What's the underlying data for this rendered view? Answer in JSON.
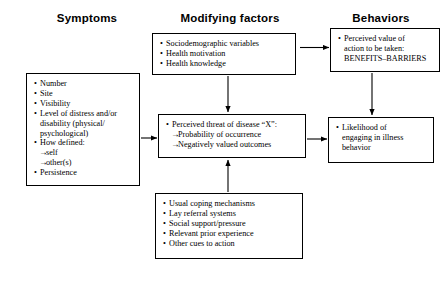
{
  "headers": [
    {
      "label": "Symptoms"
    },
    {
      "label": "Modifying factors"
    },
    {
      "label": "Behaviors"
    }
  ],
  "boxes": {
    "symptoms": {
      "name": "symptoms-box",
      "items": [
        {
          "text": "Number",
          "style": "bullet"
        },
        {
          "text": "Site",
          "style": "bullet"
        },
        {
          "text": "Visibility",
          "style": "bullet"
        },
        {
          "text": "Level of distress and/or",
          "style": "bullet"
        },
        {
          "text": "disability (physical/",
          "style": "cont"
        },
        {
          "text": "psychological)",
          "style": "cont"
        },
        {
          "text": "How defined:",
          "style": "bullet"
        },
        {
          "text": "self",
          "style": "sub"
        },
        {
          "text": "other(s)",
          "style": "sub"
        },
        {
          "text": "Persistence",
          "style": "bullet"
        }
      ]
    },
    "modifying_top": {
      "name": "modifying-factors-box",
      "items": [
        {
          "text": "Sociodemographic variables",
          "style": "bullet"
        },
        {
          "text": "Health motivation",
          "style": "bullet"
        },
        {
          "text": "Health knowledge",
          "style": "bullet"
        }
      ]
    },
    "perceived_threat": {
      "name": "perceived-threat-box",
      "items": [
        {
          "text": "Perceived threat of disease “X”:",
          "style": "bullet"
        },
        {
          "text": "Probability of occurrence",
          "style": "sub"
        },
        {
          "text": "Negatively valued outcomes",
          "style": "sub"
        }
      ]
    },
    "coping": {
      "name": "coping-mechanisms-box",
      "items": [
        {
          "text": "Usual coping mechanisms",
          "style": "bullet"
        },
        {
          "text": "Lay referral systems",
          "style": "bullet"
        },
        {
          "text": "Social support/pressure",
          "style": "bullet"
        },
        {
          "text": "Relevant prior experience",
          "style": "bullet"
        },
        {
          "text": "Other cues to action",
          "style": "bullet"
        }
      ]
    },
    "perceived_value": {
      "name": "perceived-value-box",
      "items": [
        {
          "text": "Perceived value of",
          "style": "bullet"
        },
        {
          "text": "action to be taken:",
          "style": "cont"
        },
        {
          "text": "BENEFITS–BARRIERS",
          "style": "cont"
        }
      ]
    },
    "likelihood": {
      "name": "likelihood-box",
      "items": [
        {
          "text": "Likelihood of",
          "style": "bullet"
        },
        {
          "text": "engaging in illness",
          "style": "cont"
        },
        {
          "text": "behavior",
          "style": "cont"
        }
      ]
    }
  },
  "colors": {
    "stroke": "#000000",
    "background": "#ffffff",
    "text": "#000000"
  }
}
